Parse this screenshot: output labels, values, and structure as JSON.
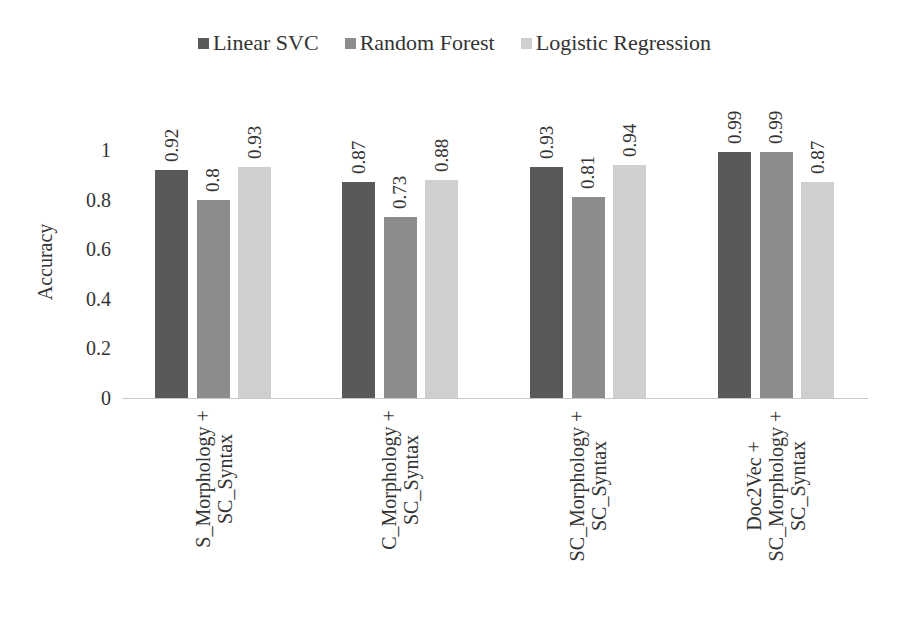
{
  "chart_data": {
    "type": "bar",
    "title": "",
    "xlabel": "",
    "ylabel": "Accuracy",
    "ylim": [
      0,
      1
    ],
    "yticks": [
      "0",
      "0.2",
      "0.4",
      "0.6",
      "0.8",
      "1"
    ],
    "grid": false,
    "legend_position": "top",
    "categories": [
      [
        "S_Morphology +",
        "SC_Syntax"
      ],
      [
        "C_Morphology +",
        "SC_Syntax"
      ],
      [
        "SC_Morphology +",
        "SC_Syntax"
      ],
      [
        "Doc2Vec +",
        "SC_Morphology +",
        "SC_Syntax"
      ]
    ],
    "series": [
      {
        "name": "Linear SVC",
        "color": "#595959",
        "values": [
          0.92,
          0.87,
          0.93,
          0.99
        ]
      },
      {
        "name": "Random Forest",
        "color": "#8c8c8c",
        "values": [
          0.8,
          0.73,
          0.81,
          0.99
        ]
      },
      {
        "name": "Logistic Regression",
        "color": "#cfcfcf",
        "values": [
          0.93,
          0.88,
          0.94,
          0.87
        ]
      }
    ],
    "value_labels": [
      [
        "0.92",
        "0.8",
        "0.93"
      ],
      [
        "0.87",
        "0.73",
        "0.88"
      ],
      [
        "0.93",
        "0.81",
        "0.94"
      ],
      [
        "0.99",
        "0.99",
        "0.87"
      ]
    ]
  }
}
